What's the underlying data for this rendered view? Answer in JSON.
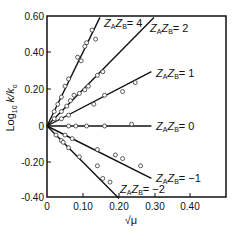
{
  "chart_data": {
    "type": "scatter",
    "title": "",
    "xlabel": "√μ",
    "ylabel": "Log10 k/k0",
    "xlim": [
      0,
      0.5
    ],
    "ylim": [
      -0.4,
      0.6
    ],
    "grid": false,
    "x_ticks": [
      "0",
      "0.10",
      "0.20",
      "0.30",
      "0.40"
    ],
    "y_ticks": [
      "0.60",
      "0.40",
      "0.20",
      "0",
      "-0.20",
      "-0.40"
    ],
    "series": [
      {
        "name": "ZAZB = 4",
        "label_main": "Z",
        "label_text": "ZAZB = 4",
        "slope": 4.08,
        "line": {
          "x": [
            0,
            0.147
          ],
          "y": [
            0,
            0.6
          ]
        },
        "points": {
          "x": [
            0.02,
            0.03,
            0.04,
            0.05,
            0.06,
            0.085,
            0.095,
            0.105,
            0.11,
            0.125,
            0.135
          ],
          "y": [
            0.08,
            0.12,
            0.16,
            0.22,
            0.26,
            0.38,
            0.36,
            0.44,
            0.46,
            0.53,
            0.48
          ]
        }
      },
      {
        "name": "ZAZB = 2",
        "label_text": "ZAZB = 2",
        "slope": 2.02,
        "line": {
          "x": [
            0,
            0.297
          ],
          "y": [
            0,
            0.6
          ]
        },
        "points": {
          "x": [
            0.02,
            0.04,
            0.055,
            0.065,
            0.075,
            0.09,
            0.105,
            0.115,
            0.14,
            0.155
          ],
          "y": [
            0.04,
            0.08,
            0.11,
            0.14,
            0.17,
            0.18,
            0.2,
            0.22,
            0.28,
            0.3
          ]
        }
      },
      {
        "name": "ZAZB = 1",
        "label_text": "ZAZB = 1",
        "slope": 1.02,
        "line": {
          "x": [
            0,
            0.29
          ],
          "y": [
            0,
            0.3
          ]
        },
        "points": {
          "x": [
            0.04,
            0.06,
            0.13,
            0.16,
            0.21,
            0.245
          ],
          "y": [
            0.04,
            0.06,
            0.12,
            0.17,
            0.19,
            0.24
          ]
        }
      },
      {
        "name": "ZAZB = 0",
        "label_text": "ZAZB = 0",
        "slope": 0,
        "line": {
          "x": [
            0,
            0.29
          ],
          "y": [
            0,
            0
          ]
        },
        "points": {
          "x": [
            0.06,
            0.08,
            0.11,
            0.16,
            0.235
          ],
          "y": [
            0,
            0,
            0,
            0,
            0.01
          ]
        }
      },
      {
        "name": "ZAZB = -1",
        "label_text": "ZAZB = -1",
        "slope": -1.0,
        "line": {
          "x": [
            0,
            0.29
          ],
          "y": [
            0,
            -0.29
          ]
        },
        "points": {
          "x": [
            0.05,
            0.07,
            0.14,
            0.19,
            0.21,
            0.26
          ],
          "y": [
            -0.05,
            -0.07,
            -0.13,
            -0.16,
            -0.18,
            -0.22
          ]
        }
      },
      {
        "name": "ZAZB = -2",
        "label_text": "ZAZB = -2",
        "slope": -2.0,
        "line": {
          "x": [
            0,
            0.2
          ],
          "y": [
            0,
            -0.4
          ]
        },
        "points": {
          "x": [
            0.025,
            0.04,
            0.045,
            0.06,
            0.09,
            0.14,
            0.155,
            0.175
          ],
          "y": [
            -0.05,
            -0.08,
            -0.09,
            -0.12,
            -0.17,
            -0.22,
            -0.29,
            -0.31
          ]
        }
      }
    ],
    "legend": "inline labels at line ends"
  },
  "labels": {
    "x_axis": "√μ",
    "y_axis_log": "Log",
    "y_axis_sub": "10",
    "y_axis_rest": " k/k",
    "y_axis_sub0": "o",
    "series_labels": [
      {
        "z": "Z",
        "a": "A",
        "b": "B",
        "val": "= 4"
      },
      {
        "z": "Z",
        "a": "A",
        "b": "B",
        "val": "= 2"
      },
      {
        "z": "Z",
        "a": "A",
        "b": "B",
        "val": "= 1"
      },
      {
        "z": "Z",
        "a": "A",
        "b": "B",
        "val": "= 0"
      },
      {
        "z": "Z",
        "a": "A",
        "b": "B",
        "val": "= −1"
      },
      {
        "z": "Z",
        "a": "A",
        "b": "B",
        "val": "= −2"
      }
    ]
  }
}
